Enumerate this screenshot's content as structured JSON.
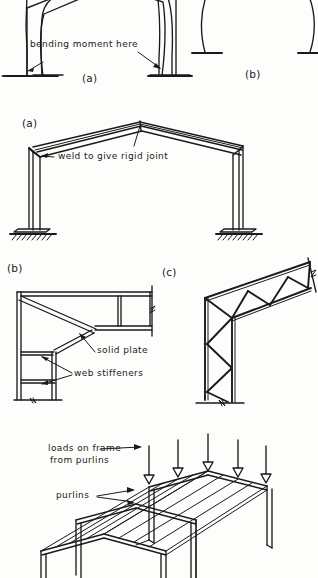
{
  "page": {
    "kind": "hand-drawn engineering sketch sheet",
    "background_color": "#fdfdfc",
    "ink_color": "#1a1a1a",
    "width": 318,
    "height": 578
  },
  "figure_top": {
    "name": "deflected-portal-frames",
    "caption_a": "(a)",
    "caption_b": "(b)",
    "annotation": "bending moment here"
  },
  "figure_middle": {
    "name": "welded-portal-frame",
    "caption": "(a)",
    "annotation": "weld to give rigid joint"
  },
  "figure_detail_b": {
    "name": "haunched-knee-detail",
    "caption": "(b)",
    "annotation_plate": "solid plate",
    "annotation_stiffeners": "web stiffeners"
  },
  "figure_detail_c": {
    "name": "lattice-knee-detail",
    "caption": "(c)"
  },
  "figure_bottom": {
    "name": "purlins-on-frames-isometric",
    "annotation_loads_line1": "loads on frame",
    "annotation_loads_line2": "from purlins",
    "annotation_purlins": "purlins"
  }
}
